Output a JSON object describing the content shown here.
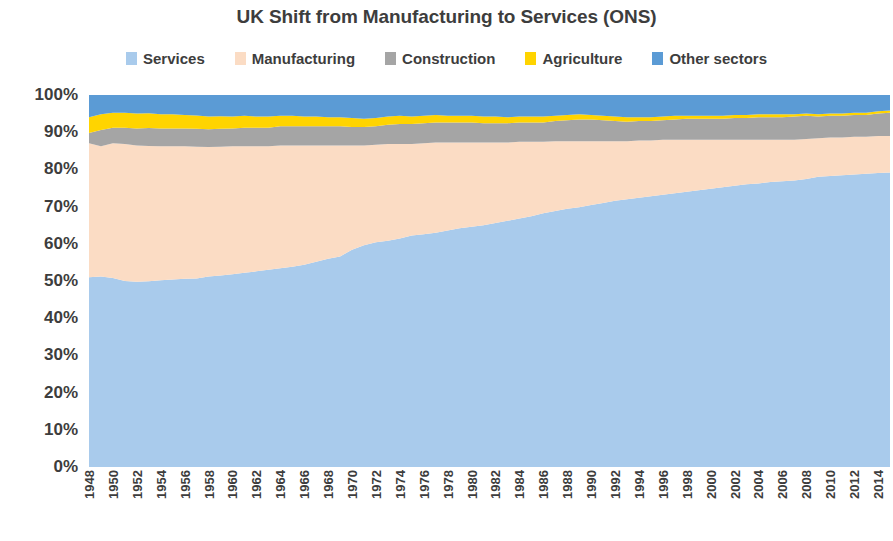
{
  "chart_data": {
    "type": "area",
    "stacked": true,
    "stacked_mode": "percent",
    "title": "UK Shift from Manufacturing to Services (ONS)",
    "xlabel": "",
    "ylabel": "",
    "ylim": [
      0,
      100
    ],
    "ytick_labels": [
      "100%",
      "90%",
      "80%",
      "70%",
      "60%",
      "50%",
      "40%",
      "30%",
      "20%",
      "10%",
      "0%"
    ],
    "ytick_values": [
      100,
      90,
      80,
      70,
      60,
      50,
      40,
      30,
      20,
      10,
      0
    ],
    "grid": false,
    "legend_position": "top",
    "x": [
      1948,
      1949,
      1950,
      1951,
      1952,
      1953,
      1954,
      1955,
      1956,
      1957,
      1958,
      1959,
      1960,
      1961,
      1962,
      1963,
      1964,
      1965,
      1966,
      1967,
      1968,
      1969,
      1970,
      1971,
      1972,
      1973,
      1974,
      1975,
      1976,
      1977,
      1978,
      1979,
      1980,
      1981,
      1982,
      1983,
      1984,
      1985,
      1986,
      1987,
      1988,
      1989,
      1990,
      1991,
      1992,
      1993,
      1994,
      1995,
      1996,
      1997,
      1998,
      1999,
      2000,
      2001,
      2002,
      2003,
      2004,
      2005,
      2006,
      2007,
      2008,
      2009,
      2010,
      2011,
      2012,
      2013,
      2014,
      2015
    ],
    "xtick_labels": [
      "1948",
      "1950",
      "1952",
      "1954",
      "1956",
      "1958",
      "1960",
      "1962",
      "1964",
      "1966",
      "1968",
      "1970",
      "1972",
      "1974",
      "1976",
      "1978",
      "1980",
      "1982",
      "1984",
      "1986",
      "1988",
      "1990",
      "1992",
      "1994",
      "1996",
      "1998",
      "2000",
      "2002",
      "2004",
      "2006",
      "2008",
      "2010",
      "2012",
      "2014"
    ],
    "series": [
      {
        "name": "Services",
        "color": "#A9CBEC",
        "values": [
          51.0,
          51.2,
          50.8,
          50.0,
          49.8,
          49.9,
          50.2,
          50.4,
          50.6,
          50.7,
          51.2,
          51.5,
          51.8,
          52.2,
          52.6,
          53.0,
          53.4,
          53.8,
          54.4,
          55.2,
          56.0,
          56.6,
          58.4,
          59.6,
          60.4,
          60.8,
          61.4,
          62.2,
          62.6,
          63.0,
          63.6,
          64.2,
          64.6,
          65.0,
          65.6,
          66.2,
          66.8,
          67.4,
          68.2,
          68.8,
          69.4,
          69.8,
          70.4,
          71.0,
          71.6,
          72.0,
          72.4,
          72.8,
          73.2,
          73.6,
          74.0,
          74.4,
          74.8,
          75.2,
          75.6,
          76.0,
          76.2,
          76.6,
          76.8,
          77.0,
          77.4,
          78.0,
          78.2,
          78.4,
          78.6,
          78.8,
          79.0,
          79.2
        ]
      },
      {
        "name": "Manufacturing",
        "color": "#FBDCC4",
        "values": [
          36.0,
          35.0,
          36.2,
          36.8,
          36.6,
          36.4,
          36.0,
          35.8,
          35.6,
          35.4,
          34.8,
          34.6,
          34.4,
          34.0,
          33.6,
          33.2,
          33.0,
          32.6,
          32.0,
          31.2,
          30.4,
          29.8,
          28.0,
          26.8,
          26.2,
          26.0,
          25.4,
          24.6,
          24.4,
          24.2,
          23.6,
          23.0,
          22.6,
          22.2,
          21.6,
          21.0,
          20.6,
          20.0,
          19.2,
          18.8,
          18.2,
          17.8,
          17.2,
          16.6,
          16.0,
          15.6,
          15.4,
          15.0,
          14.8,
          14.4,
          14.0,
          13.6,
          13.2,
          12.8,
          12.4,
          12.0,
          11.8,
          11.4,
          11.2,
          11.0,
          10.8,
          10.4,
          10.4,
          10.2,
          10.2,
          10.0,
          10.0,
          9.8
        ]
      },
      {
        "name": "Construction",
        "color": "#A5A5A5",
        "values": [
          2.8,
          4.4,
          4.2,
          4.4,
          4.6,
          4.8,
          4.8,
          4.8,
          4.8,
          4.8,
          4.8,
          4.8,
          4.8,
          5.0,
          5.0,
          5.0,
          5.2,
          5.2,
          5.2,
          5.2,
          5.2,
          5.2,
          5.0,
          5.0,
          5.0,
          5.2,
          5.4,
          5.4,
          5.4,
          5.4,
          5.4,
          5.4,
          5.4,
          5.2,
          5.2,
          5.2,
          5.2,
          5.2,
          5.2,
          5.4,
          5.6,
          5.8,
          5.8,
          5.6,
          5.4,
          5.2,
          5.2,
          5.2,
          5.2,
          5.4,
          5.6,
          5.6,
          5.6,
          5.6,
          5.8,
          5.8,
          6.0,
          6.0,
          6.0,
          6.2,
          6.2,
          5.8,
          5.8,
          5.8,
          5.8,
          5.8,
          6.0,
          6.2
        ]
      },
      {
        "name": "Agriculture",
        "color": "#FFD400",
        "values": [
          4.2,
          4.2,
          4.0,
          4.0,
          4.0,
          4.0,
          3.8,
          3.8,
          3.6,
          3.6,
          3.4,
          3.4,
          3.2,
          3.2,
          3.0,
          3.0,
          2.8,
          2.8,
          2.6,
          2.6,
          2.4,
          2.4,
          2.4,
          2.2,
          2.2,
          2.2,
          2.2,
          2.0,
          2.0,
          2.0,
          1.8,
          1.8,
          1.8,
          1.8,
          1.8,
          1.6,
          1.6,
          1.6,
          1.6,
          1.4,
          1.4,
          1.4,
          1.2,
          1.2,
          1.2,
          1.2,
          1.0,
          1.0,
          1.0,
          1.0,
          0.8,
          0.8,
          0.8,
          0.8,
          0.8,
          0.8,
          0.8,
          0.8,
          0.8,
          0.6,
          0.6,
          0.6,
          0.6,
          0.6,
          0.6,
          0.6,
          0.6,
          0.6
        ]
      },
      {
        "name": "Other sectors",
        "color": "#5B9BD5",
        "values": [
          6.0,
          5.2,
          4.8,
          4.8,
          5.0,
          4.9,
          5.2,
          5.2,
          5.4,
          5.5,
          5.8,
          5.7,
          5.8,
          5.6,
          5.8,
          5.8,
          5.6,
          5.6,
          5.8,
          5.8,
          6.0,
          6.0,
          6.2,
          6.4,
          6.2,
          5.8,
          5.6,
          5.8,
          5.6,
          5.4,
          5.6,
          5.6,
          5.6,
          5.8,
          5.8,
          6.0,
          5.8,
          5.8,
          5.8,
          5.6,
          5.4,
          5.2,
          5.4,
          5.6,
          5.8,
          6.0,
          6.0,
          6.0,
          5.8,
          5.6,
          5.6,
          5.6,
          5.6,
          5.6,
          5.4,
          5.4,
          5.2,
          5.2,
          5.2,
          5.2,
          5.0,
          5.2,
          5.0,
          5.0,
          4.8,
          4.8,
          4.4,
          4.2
        ]
      }
    ]
  },
  "legend": {
    "items": [
      {
        "label": "Services",
        "color": "#A9CBEC"
      },
      {
        "label": "Manufacturing",
        "color": "#FBDCC4"
      },
      {
        "label": "Construction",
        "color": "#A5A5A5"
      },
      {
        "label": "Agriculture",
        "color": "#FFD400"
      },
      {
        "label": "Other sectors",
        "color": "#5B9BD5"
      }
    ]
  }
}
